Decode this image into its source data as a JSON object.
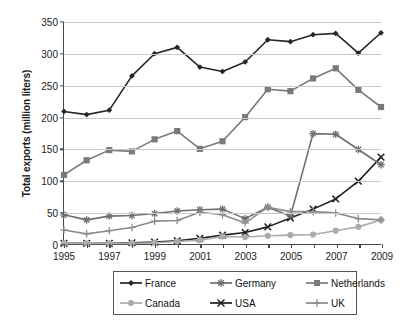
{
  "chart_data": {
    "type": "line",
    "title": "",
    "xlabel": "",
    "ylabel": "Total exports (million liters)",
    "ylim": [
      0,
      350
    ],
    "yticks": [
      0,
      50,
      100,
      150,
      200,
      250,
      300,
      350
    ],
    "xlim": [
      1995,
      2009
    ],
    "x": [
      1995,
      1996,
      1997,
      1998,
      1999,
      2000,
      2001,
      2002,
      2003,
      2004,
      2005,
      2006,
      2007,
      2008,
      2009
    ],
    "xtick_labels": [
      "1995",
      "1997",
      "1999",
      "2001",
      "2003",
      "2005",
      "2007",
      "2009"
    ],
    "xtick_values": [
      1995,
      1997,
      1999,
      2001,
      2003,
      2005,
      2007,
      2009
    ],
    "grid": "horizontal",
    "legend_position": "bottom",
    "series": [
      {
        "name": "France",
        "color": "#262626",
        "marker": "diamond",
        "values": [
          209,
          204,
          211,
          265,
          300,
          310,
          279,
          272,
          287,
          322,
          319,
          330,
          332,
          301,
          333
        ]
      },
      {
        "name": "Netherlands",
        "color": "#7a7a7a",
        "marker": "square",
        "values": [
          109,
          132,
          148,
          146,
          165,
          178,
          150,
          162,
          200,
          244,
          241,
          261,
          277,
          243,
          216
        ]
      },
      {
        "name": "USA",
        "color": "#1f1f1f",
        "marker": "x",
        "values": [
          1,
          1,
          1,
          2,
          3,
          5,
          9,
          14,
          18,
          27,
          41,
          55,
          71,
          99,
          137
        ]
      },
      {
        "name": "Germany",
        "color": "#6e6e6e",
        "marker": "star",
        "values": [
          46,
          38,
          44,
          45,
          48,
          52,
          54,
          55,
          40,
          58,
          44,
          174,
          173,
          149,
          125
        ]
      },
      {
        "name": "Canada",
        "color": "#ababab",
        "marker": "circle",
        "values": [
          1,
          1,
          1,
          1,
          2,
          4,
          6,
          12,
          11,
          13,
          14,
          15,
          21,
          27,
          38
        ]
      },
      {
        "name": "UK",
        "color": "#8c8c8c",
        "marker": "plus",
        "values": [
          22,
          16,
          21,
          26,
          36,
          37,
          50,
          46,
          33,
          58,
          51,
          51,
          49,
          40,
          38
        ]
      }
    ]
  }
}
